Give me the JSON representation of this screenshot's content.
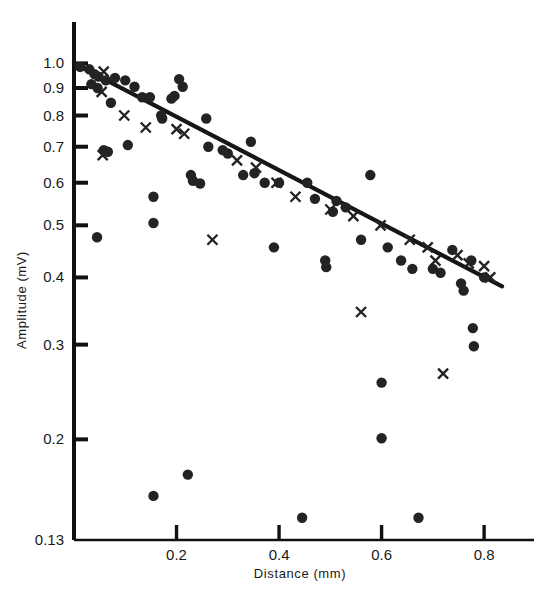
{
  "chart_data": {
    "type": "scatter",
    "title": "",
    "xlabel": "Distance (mm)",
    "ylabel": "Amplitude (mV)",
    "xlim": [
      0.0,
      0.87
    ],
    "ylim": [
      0.13,
      1.05
    ],
    "yscale": "log",
    "xscale": "linear",
    "grid": false,
    "legend": "none",
    "xticks": [
      0.2,
      0.4,
      0.6,
      0.8
    ],
    "xtick_labels": [
      "0.2",
      "0.4",
      "0.6",
      "0.8"
    ],
    "yticks": [
      0.13,
      0.2,
      0.3,
      0.4,
      0.5,
      0.6,
      0.7,
      0.8,
      0.9,
      1.0
    ],
    "ytick_labels": [
      "0.13",
      "0.2",
      "0.3",
      "0.4",
      "0.5",
      "0.6",
      "0.7",
      "0.8",
      "0.9",
      "1.0"
    ],
    "series": [
      {
        "name": "filled-circles",
        "marker": "circle",
        "color": "#232323",
        "points": [
          [
            0.012,
            0.985
          ],
          [
            0.03,
            0.975
          ],
          [
            0.04,
            0.955
          ],
          [
            0.048,
            0.945
          ],
          [
            0.034,
            0.915
          ],
          [
            0.046,
            0.9
          ],
          [
            0.062,
            0.93
          ],
          [
            0.08,
            0.94
          ],
          [
            0.072,
            0.845
          ],
          [
            0.058,
            0.69
          ],
          [
            0.066,
            0.685
          ],
          [
            0.045,
            0.475
          ],
          [
            0.1,
            0.93
          ],
          [
            0.118,
            0.905
          ],
          [
            0.105,
            0.705
          ],
          [
            0.155,
            0.565
          ],
          [
            0.155,
            0.505
          ],
          [
            0.155,
            0.157
          ],
          [
            0.133,
            0.865
          ],
          [
            0.148,
            0.865
          ],
          [
            0.17,
            0.8
          ],
          [
            0.172,
            0.79
          ],
          [
            0.19,
            0.86
          ],
          [
            0.196,
            0.87
          ],
          [
            0.205,
            0.935
          ],
          [
            0.212,
            0.905
          ],
          [
            0.222,
            0.172
          ],
          [
            0.228,
            0.62
          ],
          [
            0.232,
            0.605
          ],
          [
            0.246,
            0.598
          ],
          [
            0.258,
            0.79
          ],
          [
            0.262,
            0.7
          ],
          [
            0.29,
            0.69
          ],
          [
            0.3,
            0.68
          ],
          [
            0.33,
            0.62
          ],
          [
            0.345,
            0.715
          ],
          [
            0.352,
            0.625
          ],
          [
            0.372,
            0.6
          ],
          [
            0.39,
            0.455
          ],
          [
            0.4,
            0.6
          ],
          [
            0.445,
            0.143
          ],
          [
            0.455,
            0.6
          ],
          [
            0.47,
            0.56
          ],
          [
            0.49,
            0.43
          ],
          [
            0.492,
            0.418
          ],
          [
            0.505,
            0.53
          ],
          [
            0.512,
            0.555
          ],
          [
            0.53,
            0.54
          ],
          [
            0.56,
            0.47
          ],
          [
            0.578,
            0.62
          ],
          [
            0.6,
            0.201
          ],
          [
            0.6,
            0.255
          ],
          [
            0.612,
            0.455
          ],
          [
            0.638,
            0.43
          ],
          [
            0.66,
            0.415
          ],
          [
            0.672,
            0.143
          ],
          [
            0.7,
            0.415
          ],
          [
            0.715,
            0.408
          ],
          [
            0.738,
            0.45
          ],
          [
            0.755,
            0.39
          ],
          [
            0.76,
            0.378
          ],
          [
            0.775,
            0.43
          ],
          [
            0.778,
            0.322
          ],
          [
            0.78,
            0.298
          ],
          [
            0.8,
            0.4
          ]
        ]
      },
      {
        "name": "x-crosses",
        "marker": "x",
        "color": "#232323",
        "points": [
          [
            0.058,
            0.965
          ],
          [
            0.054,
            0.885
          ],
          [
            0.056,
            0.675
          ],
          [
            0.098,
            0.8
          ],
          [
            0.14,
            0.76
          ],
          [
            0.2,
            0.755
          ],
          [
            0.215,
            0.74
          ],
          [
            0.27,
            0.47
          ],
          [
            0.318,
            0.66
          ],
          [
            0.355,
            0.64
          ],
          [
            0.395,
            0.6
          ],
          [
            0.432,
            0.565
          ],
          [
            0.5,
            0.535
          ],
          [
            0.545,
            0.52
          ],
          [
            0.56,
            0.345
          ],
          [
            0.598,
            0.5
          ],
          [
            0.655,
            0.47
          ],
          [
            0.69,
            0.455
          ],
          [
            0.705,
            0.43
          ],
          [
            0.72,
            0.265
          ],
          [
            0.748,
            0.44
          ],
          [
            0.77,
            0.425
          ],
          [
            0.8,
            0.42
          ],
          [
            0.812,
            0.4
          ]
        ]
      }
    ],
    "trend_line": {
      "name": "regression-line",
      "start": [
        0.0,
        1.0
      ],
      "end": [
        0.835,
        0.385
      ],
      "color": "#161616"
    }
  }
}
